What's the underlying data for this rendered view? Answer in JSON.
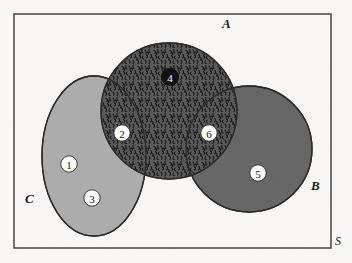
{
  "figure": {
    "type": "venn-diagram",
    "universe_label": "S",
    "background_color": "#f8f7f5",
    "border_color": "#3a3a3a"
  },
  "sets": [
    {
      "id": "A",
      "label": "A",
      "shape": "circle",
      "fill": "#fbfbf9",
      "pattern": "dotted",
      "stroke": "#2a2a2a",
      "label_x": 222,
      "label_y": 28
    },
    {
      "id": "B",
      "label": "B",
      "shape": "circle",
      "fill": "#666666",
      "pattern": "solid",
      "stroke": "#2a2a2a",
      "label_x": 311,
      "label_y": 190
    },
    {
      "id": "C",
      "label": "C",
      "shape": "ellipse",
      "fill": "#acacac",
      "pattern": "solid",
      "stroke": "#2a2a2a",
      "label_x": 25,
      "label_y": 203
    }
  ],
  "regions": [
    {
      "number": "1",
      "description": "C only",
      "fill": "#acacac",
      "pattern": "solid",
      "label_style": "light",
      "x": 69,
      "y": 164
    },
    {
      "number": "2",
      "description": "A intersect C",
      "fill": "#acacac",
      "pattern": "horizontal-stripes-with-dots",
      "label_style": "light",
      "x": 122,
      "y": 133
    },
    {
      "number": "3",
      "description": "C only lower",
      "fill": "#acacac",
      "pattern": "solid",
      "label_style": "light",
      "x": 92,
      "y": 198
    },
    {
      "number": "4",
      "description": "A only",
      "fill": "#111111",
      "pattern": "dotted",
      "label_style": "dark",
      "x": 170,
      "y": 77
    },
    {
      "number": "5",
      "description": "B only",
      "fill": "#666666",
      "pattern": "solid",
      "label_style": "light",
      "x": 258,
      "y": 173
    },
    {
      "number": "6",
      "description": "A intersect B",
      "fill": "#555555",
      "pattern": "speckled",
      "label_style": "light",
      "x": 209,
      "y": 133
    }
  ],
  "geometry": {
    "frame": {
      "x": 14,
      "y": 14,
      "width": 317,
      "height": 234
    },
    "circle_a": {
      "cx": 169,
      "cy": 111,
      "r": 68
    },
    "circle_b": {
      "cx": 249,
      "cy": 149,
      "r": 63
    },
    "ellipse_c": {
      "cx": 94,
      "cy": 156,
      "rx": 52,
      "ry": 80
    },
    "universe_label": {
      "x": 335,
      "y": 245
    }
  }
}
